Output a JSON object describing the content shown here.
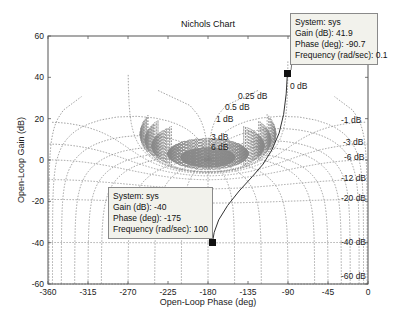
{
  "chart_data": {
    "type": "line",
    "title": "Nichols Chart",
    "xlabel": "Open-Loop Phase (deg)",
    "ylabel": "Open-Loop Gain (dB)",
    "xlim": [
      -360,
      0
    ],
    "ylim": [
      -60,
      60
    ],
    "xticks": [
      -360,
      -315,
      -270,
      -225,
      -180,
      -135,
      -90,
      -45,
      0
    ],
    "yticks": [
      -60,
      -40,
      -20,
      0,
      20,
      40,
      60
    ],
    "grid": true,
    "grid_type": "nichols",
    "grid_labels": [
      "0 dB",
      "0.25 dB",
      "0.5 dB",
      "1 dB",
      "3 dB",
      "6 dB",
      "-1 dB",
      "-3 dB",
      "-6 dB",
      "-12 dB",
      "-20 dB",
      "-40 dB",
      "-60 dB"
    ],
    "series": [
      {
        "name": "sys",
        "phase": [
          -90.7,
          -92,
          -95,
          -100,
          -108,
          -118,
          -130,
          -145,
          -158,
          -168,
          -173,
          -175
        ],
        "gain": [
          41.9,
          32,
          22,
          13,
          5,
          -2,
          -8,
          -15,
          -22,
          -29,
          -35,
          -40
        ]
      }
    ],
    "datatips": [
      {
        "system": "sys",
        "gain_db": 41.9,
        "phase_deg": -90.7,
        "frequency_rad_s": 0.1
      },
      {
        "system": "sys",
        "gain_db": -40,
        "phase_deg": -175,
        "frequency_rad_s": 100
      }
    ]
  },
  "labels": {
    "title": "Nichols Chart",
    "xlabel": "Open-Loop Phase (deg)",
    "ylabel": "Open-Loop Gain (dB)"
  },
  "datatip1": {
    "line1": "System: sys",
    "line2": "Gain (dB): 41.9",
    "line3": "Phase (deg): -90.7",
    "line4": "Frequency (rad/sec): 0.1"
  },
  "datatip2": {
    "line1": "System: sys",
    "line2": "Gain (dB): -40",
    "line3": "Phase (deg): -175",
    "line4": "Frequency (rad/sec): 100"
  },
  "colors": {
    "grid": "#888888",
    "curve": "#333333",
    "axes": "#444444"
  }
}
